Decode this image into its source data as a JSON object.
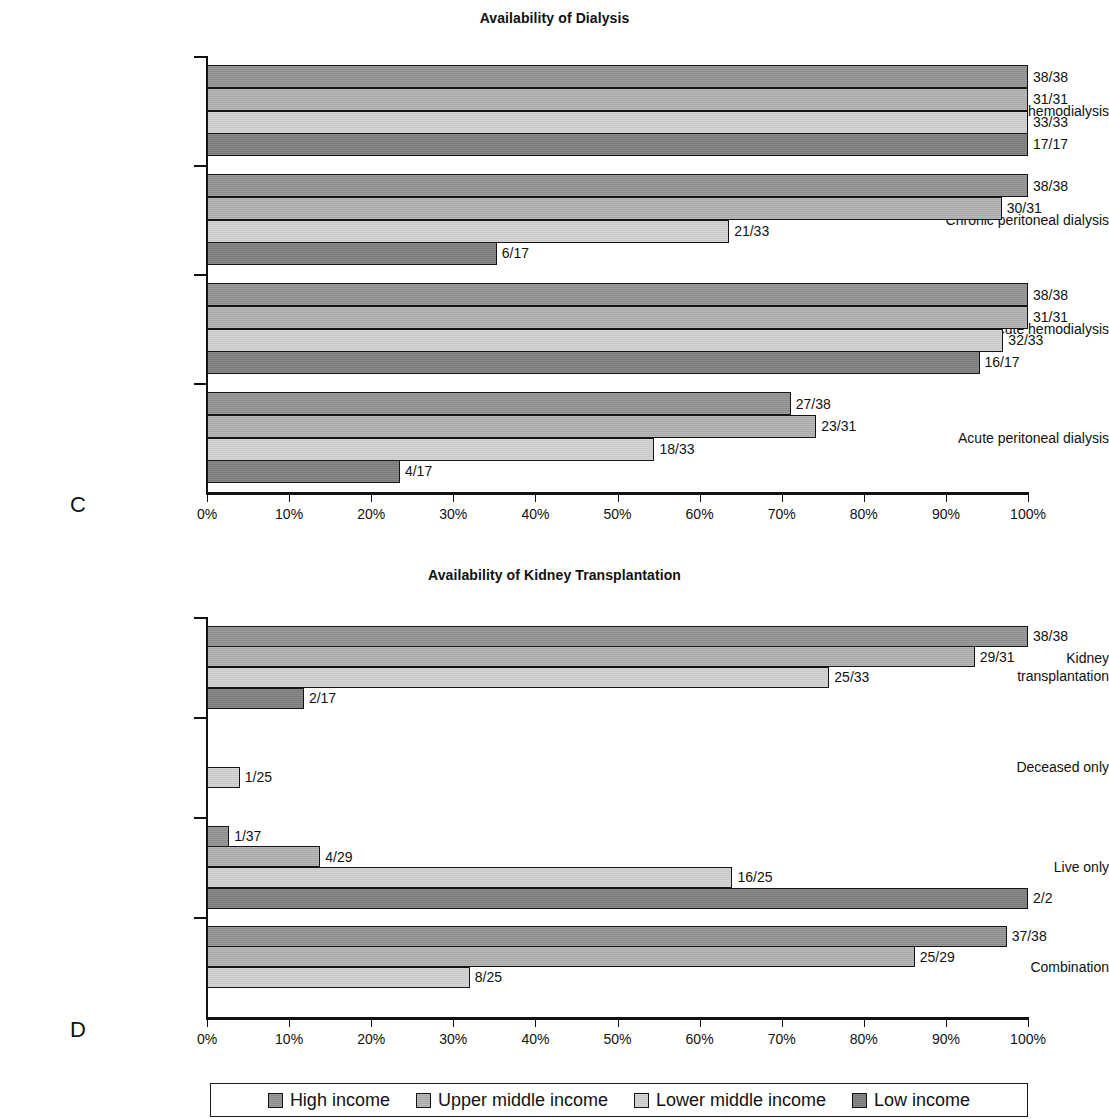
{
  "figure": {
    "panels": [
      {
        "letter": "C",
        "title": "Availability of Dialysis"
      },
      {
        "letter": "D",
        "title": "Availability of Kidney Transplantation"
      }
    ],
    "legend": {
      "items": [
        {
          "label": "High income",
          "color": "#8b8b8b"
        },
        {
          "label": "Upper middle income",
          "color": "#a9a9a9"
        },
        {
          "label": "Lower middle income",
          "color": "#c9c9c9"
        },
        {
          "label": "Low income",
          "color": "#7a7a7a"
        }
      ]
    }
  },
  "chart_data": [
    {
      "type": "bar",
      "orientation": "horizontal",
      "panel": "C",
      "title": "Availability of Dialysis",
      "xlabel": "",
      "ylabel": "",
      "xlim": [
        0,
        100
      ],
      "xticks": [
        "0%",
        "10%",
        "20%",
        "30%",
        "40%",
        "50%",
        "60%",
        "70%",
        "80%",
        "90%",
        "100%"
      ],
      "grid": false,
      "legend_position": "bottom",
      "categories": [
        "Chronic hemodialysis",
        "Chronic peritoneal dialysis",
        "Acute hemodialysis",
        "Acute peritoneal dialysis"
      ],
      "series": [
        {
          "name": "High income",
          "values": [
            100.0,
            100.0,
            100.0,
            71.1
          ],
          "labels": [
            "38/38",
            "38/38",
            "38/38",
            "27/38"
          ]
        },
        {
          "name": "Upper middle income",
          "values": [
            100.0,
            96.8,
            100.0,
            74.2
          ],
          "labels": [
            "31/31",
            "30/31",
            "31/31",
            "23/31"
          ]
        },
        {
          "name": "Lower middle income",
          "values": [
            100.0,
            63.6,
            97.0,
            54.5
          ],
          "labels": [
            "33/33",
            "21/33",
            "32/33",
            "18/33"
          ]
        },
        {
          "name": "Low income",
          "values": [
            100.0,
            35.3,
            94.1,
            23.5
          ],
          "labels": [
            "17/17",
            "6/17",
            "16/17",
            "4/17"
          ]
        }
      ]
    },
    {
      "type": "bar",
      "orientation": "horizontal",
      "panel": "D",
      "title": "Availability of Kidney Transplantation",
      "xlabel": "",
      "ylabel": "",
      "xlim": [
        0,
        100
      ],
      "xticks": [
        "0%",
        "10%",
        "20%",
        "30%",
        "40%",
        "50%",
        "60%",
        "70%",
        "80%",
        "90%",
        "100%"
      ],
      "grid": false,
      "legend_position": "bottom",
      "categories": [
        "Kidney transplantation",
        "Deceased only",
        "Live only",
        "Combination"
      ],
      "series": [
        {
          "name": "High income",
          "values": [
            100.0,
            null,
            2.7,
            97.4
          ],
          "labels": [
            "38/38",
            null,
            "1/37",
            "37/38"
          ]
        },
        {
          "name": "Upper middle income",
          "values": [
            93.5,
            null,
            13.8,
            86.2
          ],
          "labels": [
            "29/31",
            null,
            "4/29",
            "25/29"
          ]
        },
        {
          "name": "Lower middle income",
          "values": [
            75.8,
            4.0,
            64.0,
            32.0
          ],
          "labels": [
            "25/33",
            "1/25",
            "16/25",
            "8/25"
          ]
        },
        {
          "name": "Low income",
          "values": [
            11.8,
            null,
            100.0,
            null
          ],
          "labels": [
            "2/17",
            null,
            "2/2",
            null
          ]
        }
      ]
    }
  ]
}
